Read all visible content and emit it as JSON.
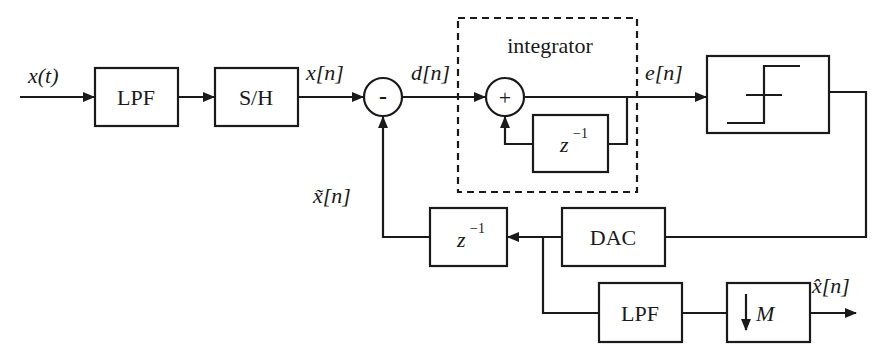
{
  "diagram": {
    "input_signal": "x(t)",
    "blocks": {
      "lpf_input": "LPF",
      "sample_hold": "S/H",
      "subtractor_sign": "-",
      "adder_sign": "+",
      "integrator_group": "integrator",
      "integrator_delay": {
        "base": "z",
        "exp": "−1"
      },
      "quantizer": "comparator/quantizer (step symbol)",
      "dac": "DAC",
      "feedback_delay": {
        "base": "z",
        "exp": "−1"
      },
      "lpf_output": "LPF",
      "decimator": {
        "arrow": "↓",
        "factor": "M"
      }
    },
    "signals": {
      "sampled": "x[n]",
      "difference": "d[n]",
      "integrated": "e[n]",
      "feedback": "x̃[n]",
      "output": "x̂[n]"
    },
    "line_color": "#1a1a1a",
    "background": "#ffffff"
  }
}
